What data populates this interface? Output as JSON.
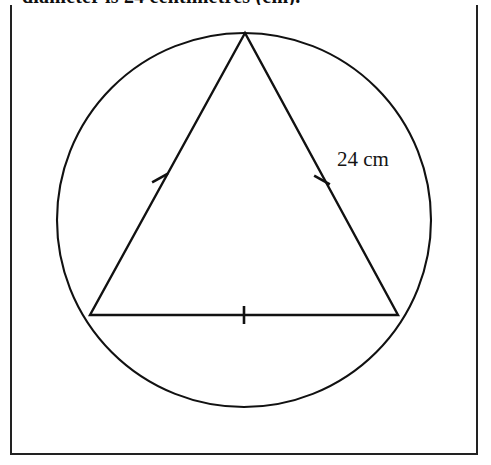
{
  "page": {
    "background_color": "#ffffff",
    "width": 491,
    "height": 465
  },
  "question": {
    "clipped_text": "diameter is 24 centimetres (cm)."
  },
  "figure": {
    "frame": {
      "border_color": "#222222",
      "border_width_px": 2
    },
    "stroke_color": "#111111",
    "circle": {
      "name": "circumscribed-circle",
      "center_x": 244,
      "center_y": 220,
      "radius": 187
    },
    "triangle": {
      "name": "inscribed-equilateral-triangle",
      "vertices": [
        {
          "label": "apex",
          "x": 245,
          "y": 33
        },
        {
          "label": "bottom-left",
          "x": 90,
          "y": 315
        },
        {
          "label": "bottom-right",
          "x": 398,
          "y": 315
        }
      ]
    },
    "tick_marks": [
      {
        "name": "tick-left-side",
        "x": 160,
        "y": 178,
        "angle_deg": 61
      },
      {
        "name": "tick-right-side",
        "x": 322,
        "y": 180,
        "angle_deg": -61
      },
      {
        "name": "tick-base",
        "x": 244,
        "y": 315,
        "angle_deg": 0
      }
    ],
    "labels": [
      {
        "name": "side-length-label",
        "text": "24 cm",
        "x": 337,
        "y": 166
      }
    ]
  }
}
